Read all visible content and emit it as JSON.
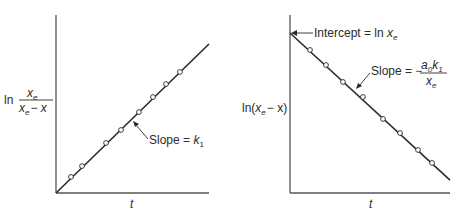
{
  "figure": {
    "left_panel": {
      "y_label": {
        "prefix": "ln",
        "numerator": "x",
        "numerator_sub": "e",
        "denominator": "x",
        "denominator_sub": "e",
        "denominator_tail": "− x"
      },
      "x_label": "t",
      "annotation": {
        "text": "Slope = ",
        "symbol": "k",
        "symbol_sub": "1"
      }
    },
    "right_panel": {
      "y_label": {
        "prefix": "ln(",
        "var": "x",
        "var_sub": "e",
        "tail": "− x)"
      },
      "x_label": "t",
      "intercept_annotation": {
        "text": "Intercept = ln ",
        "symbol": "x",
        "symbol_sub": "e"
      },
      "slope_annotation": {
        "text": "Slope = −",
        "numerator_a": "a",
        "numerator_a_sub": "0",
        "numerator_k": "k",
        "numerator_k_sub": "1",
        "denominator": "x",
        "denominator_sub": "e"
      }
    },
    "colors": {
      "line": "#2a2a2a",
      "axis": "#555555",
      "marker_fill": "#ffffff"
    }
  },
  "chart_data": [
    {
      "type": "scatter",
      "title": "",
      "xlabel": "t",
      "ylabel": "ln x_e/(x_e − x)",
      "grid": false,
      "xlim": [
        0,
        10
      ],
      "ylim": [
        0,
        11.6
      ],
      "series": [
        {
          "name": "data",
          "x": [
            0.98,
            1.7,
            3.27,
            4.25,
            5.42,
            6.34,
            7.19,
            8.1
          ],
          "y": [
            1.05,
            1.76,
            3.27,
            4.12,
            5.29,
            6.27,
            7.12,
            7.91
          ]
        },
        {
          "name": "fit line",
          "x": [
            0,
            10
          ],
          "y": [
            0,
            9.74
          ]
        }
      ],
      "annotations": [
        "Slope = k_1"
      ]
    },
    {
      "type": "scatter",
      "title": "",
      "xlabel": "t",
      "ylabel": "ln(x_e − x)",
      "grid": false,
      "xlim": [
        0,
        10
      ],
      "ylim": [
        0,
        11
      ],
      "series": [
        {
          "name": "data",
          "x": [
            1.25,
            2.25,
            3.31,
            4.56,
            5.81,
            6.88,
            8.0,
            8.88
          ],
          "y": [
            8.94,
            8.0,
            6.94,
            6.0,
            4.63,
            3.75,
            2.69,
            1.88
          ]
        },
        {
          "name": "fit line",
          "x": [
            0,
            10
          ],
          "y": [
            10.0,
            0.81
          ]
        }
      ],
      "annotations": [
        "Intercept = ln x_e",
        "Slope = − a_0 k_1 / x_e"
      ]
    }
  ]
}
